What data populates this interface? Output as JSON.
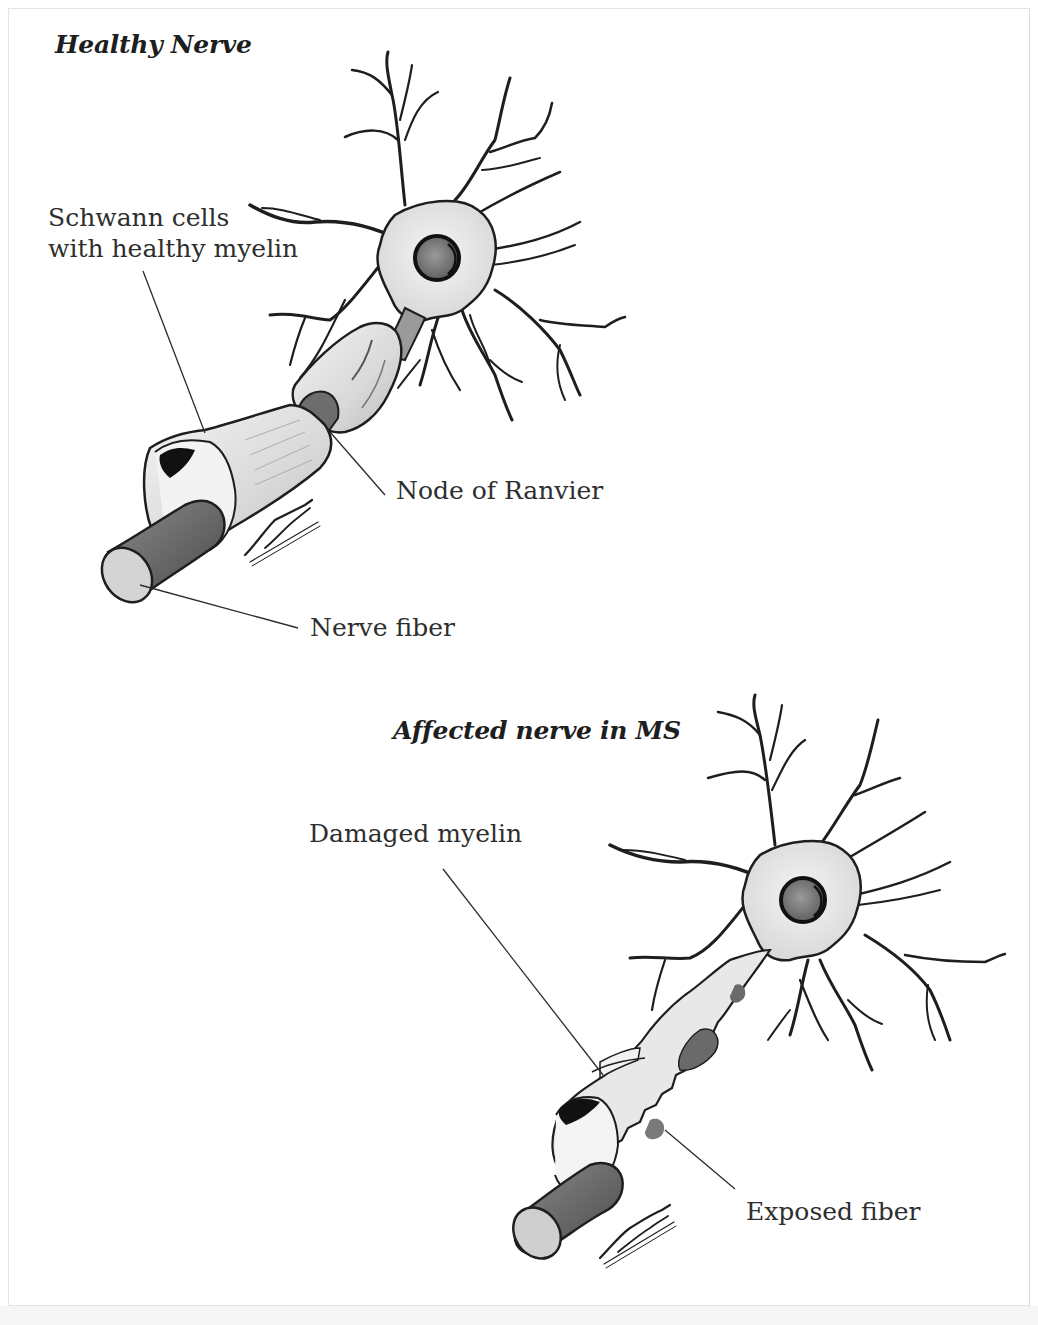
{
  "figure": {
    "healthy": {
      "title": "Healthy Nerve",
      "labels": {
        "schwann_line1": "Schwann cells",
        "schwann_line2": "with healthy myelin",
        "node": "Node of Ranvier",
        "fiber": "Nerve fiber"
      },
      "signature": "Arian"
    },
    "ms": {
      "title": "Affected nerve in MS",
      "labels": {
        "damaged": "Damaged myelin",
        "exposed": "Exposed fiber"
      },
      "signature": "Arian"
    },
    "colors": {
      "ink": "#1e1e1e",
      "soma_fill": "#ececec",
      "myelin_fill": "#e2e2e2",
      "axon_fill": "#6a6a6a",
      "node_fill": "#777777",
      "fiber_end": "#cfcfcf",
      "background": "#ffffff"
    }
  }
}
